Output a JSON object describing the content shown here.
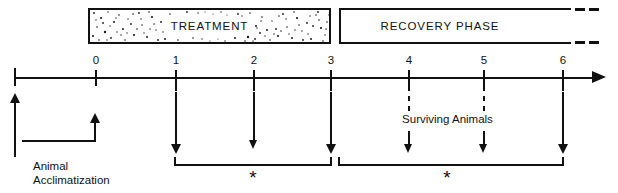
{
  "figure": {
    "type": "experimental-timeline",
    "background_color": "#ffffff",
    "line_color": "#111111"
  },
  "phases": [
    {
      "id": "treatment",
      "label": "TREATMENT",
      "fill": "stippled",
      "start_time": 0,
      "end_time": 3,
      "open_ended": false
    },
    {
      "id": "recovery",
      "label": "RECOVERY PHASE",
      "fill": "white",
      "start_time": 3,
      "end_time": 6,
      "open_ended": true,
      "continuation": "dashed"
    }
  ],
  "axis": {
    "ticks": [
      {
        "label": "0",
        "x": 95
      },
      {
        "label": "1",
        "x": 175
      },
      {
        "label": "2",
        "x": 253
      },
      {
        "label": "3",
        "x": 330
      },
      {
        "label": "4",
        "x": 408
      },
      {
        "label": "5",
        "x": 483
      },
      {
        "label": "6",
        "x": 562
      }
    ],
    "arrow_direction": "right",
    "origin_x": 14
  },
  "sampling_arrows": [
    {
      "tick": "1",
      "x": 175,
      "weight": "bold",
      "top": 92,
      "bottom": 157
    },
    {
      "tick": "2",
      "x": 253,
      "weight": "thin",
      "top": 92,
      "bottom": 155
    },
    {
      "tick": "3",
      "x": 330,
      "weight": "bold",
      "top": 92,
      "bottom": 157
    },
    {
      "tick": "4",
      "x": 408,
      "weight": "thin",
      "top": 135,
      "bottom": 157
    },
    {
      "tick": "5",
      "x": 483,
      "weight": "thin",
      "top": 135,
      "bottom": 157
    },
    {
      "tick": "6",
      "x": 562,
      "weight": "bold",
      "top": 92,
      "bottom": 157
    }
  ],
  "brackets": [
    {
      "id": "treatment-sampling",
      "from_tick": "1",
      "to_tick": "3",
      "marker": "*"
    },
    {
      "id": "recovery-sampling",
      "from_tick": "3",
      "to_tick": "6",
      "marker": "*"
    }
  ],
  "annotations": {
    "surviving_animals": "Surviving Animals",
    "acclimatization_line1": "Animal",
    "acclimatization_line2": "Acclimatization",
    "asterisk_left": "*",
    "asterisk_right": "*"
  }
}
